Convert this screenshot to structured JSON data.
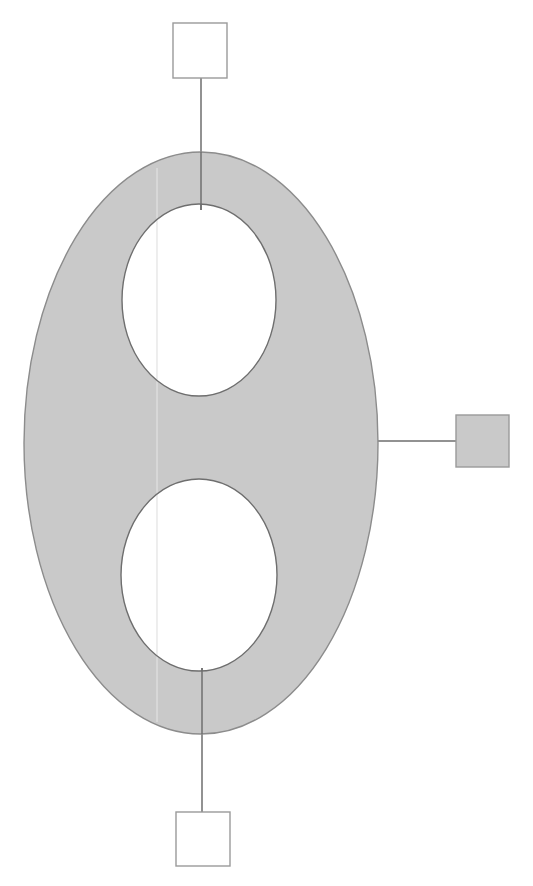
{
  "canvas": {
    "width": 533,
    "height": 886,
    "background": "#ffffff"
  },
  "diagram": {
    "type": "node-link-shape-diagram",
    "colors": {
      "shape_fill": "#c9c9c9",
      "shape_stroke": "#8c8c8c",
      "hole_fill": "#ffffff",
      "hole_stroke": "#6e6e6e",
      "node_fill_empty": "#ffffff",
      "node_fill_filled": "#c9c9c9",
      "node_stroke": "#9a9a9a",
      "connector_stroke": "#6e6e6e",
      "seam_stroke": "#e2e2e2"
    },
    "body": {
      "name": "outer-ellipse",
      "cx": 201,
      "cy": 443,
      "rx": 177,
      "ry": 291,
      "stroke_width": 1.4
    },
    "holes": [
      {
        "name": "upper-hole",
        "cx": 199,
        "cy": 300,
        "rx": 77,
        "ry": 96,
        "stroke_width": 1.4
      },
      {
        "name": "lower-hole",
        "cx": 199,
        "cy": 575,
        "rx": 78,
        "ry": 96,
        "stroke_width": 1.4
      }
    ],
    "seam": {
      "name": "vertical-seam-line",
      "x": 157,
      "y1": 168,
      "y2": 722,
      "stroke_width": 1.2
    },
    "nodes": [
      {
        "id": "node-top",
        "name": "top-node-square",
        "x": 173,
        "y": 23,
        "width": 54,
        "height": 55,
        "filled": false,
        "label": ""
      },
      {
        "id": "node-right",
        "name": "right-node-square",
        "x": 456,
        "y": 415,
        "width": 53,
        "height": 52,
        "filled": true,
        "label": ""
      },
      {
        "id": "node-bottom",
        "name": "bottom-node-square",
        "x": 176,
        "y": 812,
        "width": 54,
        "height": 54,
        "filled": false,
        "label": ""
      }
    ],
    "connectors": [
      {
        "id": "connector-top",
        "name": "connector-top-vertical",
        "orientation": "vertical",
        "x1": 201,
        "y1": 78,
        "x2": 201,
        "y2": 210,
        "stroke_width": 1.5
      },
      {
        "id": "connector-right",
        "name": "connector-right-horizontal",
        "orientation": "horizontal",
        "x1": 378,
        "y1": 441,
        "x2": 456,
        "y2": 441,
        "stroke_width": 1.5
      },
      {
        "id": "connector-bottom",
        "name": "connector-bottom-vertical",
        "orientation": "vertical",
        "x1": 202,
        "y1": 668,
        "x2": 202,
        "y2": 812,
        "stroke_width": 1.5
      }
    ]
  }
}
